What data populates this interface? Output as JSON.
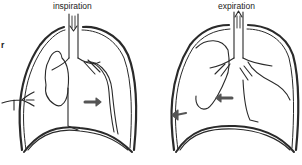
{
  "diagram": {
    "panels": [
      {
        "id": "inspiration",
        "label": "inspiration",
        "air_direction": "down",
        "mediastinum_shift": "right"
      },
      {
        "id": "expiration",
        "label": "expiration",
        "air_direction": "up",
        "mediastinum_shift": "left"
      }
    ],
    "edge_text": "r",
    "colors": {
      "stroke": "#2a2a2a",
      "arrow": "#555555",
      "background": "#ffffff"
    }
  }
}
